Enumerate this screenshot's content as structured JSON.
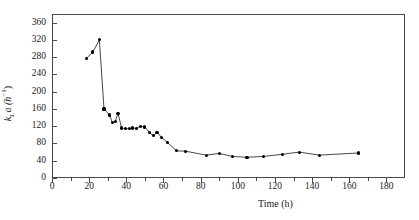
{
  "chart_data": {
    "type": "line",
    "title": "",
    "xlabel": "Time (h)",
    "ylabel": "kLa (h-1)",
    "ylabel_parts": {
      "base": "k",
      "sub": "L",
      "mid": "a (h",
      "sup": "−1",
      "end": ")"
    },
    "xlim": [
      0,
      190
    ],
    "ylim": [
      0,
      380
    ],
    "xticks": [
      0,
      20,
      40,
      60,
      80,
      100,
      120,
      140,
      160,
      180
    ],
    "xticks_minor": [
      10,
      30,
      50,
      70,
      90,
      110,
      130,
      150,
      170
    ],
    "yticks": [
      0,
      40,
      80,
      120,
      160,
      200,
      240,
      280,
      320,
      360
    ],
    "grid": false,
    "legend": null,
    "marker": "filled-circle",
    "line_color": "#333333",
    "marker_color": "#000000",
    "x": [
      18.5,
      22.0,
      25.5,
      28.0,
      31.0,
      32.5,
      34.0,
      35.5,
      37.5,
      39.5,
      41.5,
      43.5,
      45.5,
      47.5,
      50.0,
      52.5,
      54.5,
      56.5,
      59.0,
      62.0,
      67.0,
      72.0,
      83.0,
      90.0,
      97.0,
      105.0,
      114.0,
      124.0,
      133.0,
      144.0,
      165.0
    ],
    "y": [
      277,
      292,
      320,
      160,
      146,
      128,
      131,
      150,
      116,
      114,
      114,
      116,
      115,
      120,
      118,
      105,
      98,
      106,
      94,
      83,
      63,
      62,
      53,
      57,
      50,
      48,
      50,
      55,
      60,
      53,
      58
    ]
  },
  "axes": {
    "x_tick_labels": [
      "0",
      "20",
      "40",
      "60",
      "80",
      "100",
      "120",
      "140",
      "160",
      "180"
    ],
    "y_tick_labels": [
      "0",
      "40",
      "80",
      "120",
      "160",
      "200",
      "240",
      "280",
      "320",
      "360"
    ]
  }
}
